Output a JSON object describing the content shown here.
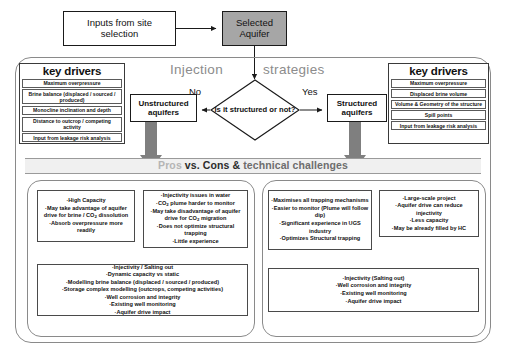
{
  "top": {
    "inputs_box": "Inputs from site selection",
    "selected_aquifer": "Selected Aquifer",
    "aquifer_fill": "#a6a6a6"
  },
  "middle": {
    "word_left": "Injection",
    "word_right": "strategies",
    "decision": "Is it structured or not?",
    "label_no": "No",
    "label_yes": "Yes",
    "unstructured": "Unstructured aquifers",
    "structured": "Structured aquifers"
  },
  "key_drivers_left": {
    "title": "key drivers",
    "items": [
      "Maximum overpressure",
      "Brine balance (displaced / sourced / produced)",
      "Monocline inclination and depth",
      "Distance to outcrop / competing activity",
      "Input from leakage risk analysis"
    ]
  },
  "key_drivers_right": {
    "title": "key drivers",
    "items": [
      "Maximum overpressure",
      "Displaced brine volume",
      "Volume & Geometry of the structure",
      "Spill points",
      "Input from leakage risk analysis"
    ]
  },
  "band": {
    "pros_word": "Pros",
    "vs_word": "vs.",
    "cons_word": "Cons &",
    "tail_word": "technical challenges",
    "full": "Pros vs. Cons & technical challenges"
  },
  "boxes": {
    "unstructured_pros": [
      "High Capacity",
      "May take advantage of aquifer drive for brine / CO2 dissolution",
      "Absorb overpressure more readily"
    ],
    "unstructured_cons": [
      "Injectivity issues in water",
      "CO2 plume harder to monitor",
      "May take disadvantage of aquifer drive for CO2 migration",
      "Does not optimize structural trapping",
      "Little experience"
    ],
    "structured_pros": [
      "Maximises all trapping mechanisms",
      "Easier to monitor (Plume will follow dip)",
      "Significant experience in UGS industry",
      "Optimizes Structural trapping"
    ],
    "structured_cons": [
      "Large-scale project",
      "Aquifer drive can reduce injectivity",
      "Less capacity",
      "May be already filled by HC"
    ],
    "unstructured_technical": [
      "Injectivity / Salting out",
      "Dynamic capacity vs static",
      "Modelling brine balance (displaced / sourced / produced)",
      "Storage complex modelling (outcrops, competing activities)",
      "Well corrosion and integrity",
      "Existing well monitoring",
      "Aquifer drive impact"
    ],
    "structured_technical": [
      "Injectivity  (Salting out)",
      "Well corrosion and integrity",
      "Existing well monitoring",
      "Aquifer drive impact"
    ]
  },
  "colors": {
    "arrow_grey": "#808080",
    "band_grey": "#f0f0f0",
    "outline": "#1a1a1a"
  }
}
